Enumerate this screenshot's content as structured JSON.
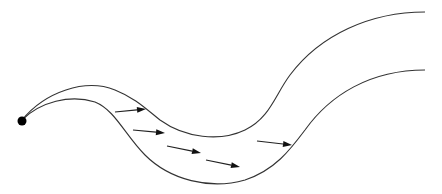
{
  "diagram": {
    "source_point": {
      "name": "origin",
      "color": "#000000"
    },
    "streamlines": [
      {
        "name": "upper-boundary"
      },
      {
        "name": "lower-boundary"
      }
    ],
    "flow_arrows_count": 5,
    "colors": {
      "line": "#333333",
      "arrow": "#111111",
      "background": "#ffffff"
    }
  }
}
